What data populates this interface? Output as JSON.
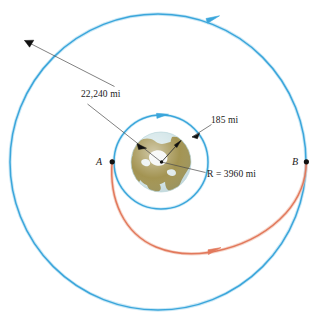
{
  "figure": {
    "background_color": "#ffffff"
  },
  "colors": {
    "orbit_blue": "#3ba6db",
    "orbit_blue_light": "#7fc8e8",
    "transfer_orange": "#e2795c",
    "transfer_orange_light": "#edaa93",
    "leader_line": "#4a4a4a",
    "text": "#1a1a1a",
    "earth_ocean": "#cfe3e6",
    "earth_land": "#99883f",
    "earth_ice": "#f2f4f2",
    "point_marker": "#111111"
  },
  "labels": {
    "outer_orbit_altitude": "22,240 mi",
    "inner_orbit_altitude": "185 mi",
    "earth_radius": "R = 3960 mi",
    "point_a": "A",
    "point_b": "B"
  },
  "geometry": {
    "center": {
      "x": 158,
      "y": 162
    },
    "outer_orbit_radius": 148,
    "inner_orbit_radius": 47,
    "earth_radius": 30,
    "point_a": {
      "x": 112,
      "y": 162
    },
    "point_b": {
      "x": 306,
      "y": 162
    }
  },
  "elements": {
    "outer_orbit_name": "geosynchronous-orbit-circle",
    "inner_orbit_name": "low-earth-orbit-circle",
    "transfer_orbit_name": "transfer-ellipse-arc",
    "earth_name": "earth-globe"
  }
}
